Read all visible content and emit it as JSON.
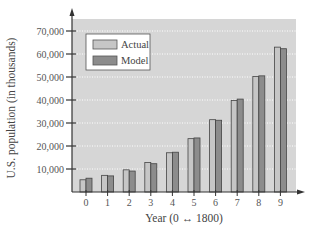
{
  "chart_data": {
    "type": "bar",
    "title": "",
    "xlabel": "Year (0 ↔ 1800)",
    "ylabel": "U.S. population (in thousands)",
    "categories": [
      "0",
      "1",
      "2",
      "3",
      "4",
      "5",
      "6",
      "7",
      "8",
      "9"
    ],
    "series": [
      {
        "name": "Actual",
        "color": "#c6c6c6",
        "values": [
          5308,
          7240,
          9639,
          12861,
          17063,
          23192,
          31443,
          39818,
          50189,
          62980
        ]
      },
      {
        "name": "Model",
        "color": "#8c8c8c",
        "values": [
          6000,
          7000,
          9100,
          12300,
          17300,
          23500,
          31200,
          40400,
          50500,
          62300
        ]
      }
    ],
    "yticks": [
      10000,
      20000,
      30000,
      40000,
      50000,
      60000,
      70000
    ],
    "ytick_labels": [
      "10,000",
      "20,000",
      "30,000",
      "40,000",
      "50,000",
      "60,000",
      "70,000"
    ],
    "ylim": [
      0,
      75000
    ],
    "grid": true,
    "grid_style": "dotted horizontal",
    "legend_position": "upper left",
    "plot_background": "#d6d6d6"
  }
}
